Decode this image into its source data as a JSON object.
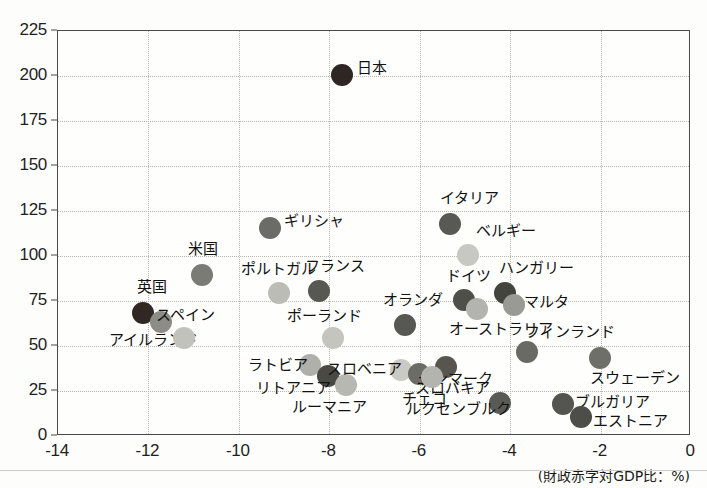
{
  "chart_data": {
    "type": "scatter",
    "title": "",
    "xlabel": "(財政赤字対GDP比：%)",
    "ylabel": "",
    "xlim": [
      -14,
      0
    ],
    "ylim": [
      0,
      225
    ],
    "grid": true,
    "legend": "none",
    "xticks": [
      "-14",
      "-12",
      "-10",
      "-8",
      "-6",
      "-4",
      "-2",
      "0"
    ],
    "xtick_values": [
      -14,
      -12,
      -10,
      -8,
      -6,
      -4,
      -2,
      0
    ],
    "yticks": [
      "0",
      "25",
      "50",
      "75",
      "100",
      "125",
      "150",
      "175",
      "200",
      "225"
    ],
    "ytick_values": [
      0,
      25,
      50,
      75,
      100,
      125,
      150,
      175,
      200,
      225
    ],
    "points": [
      {
        "label": "日本",
        "x": -7.7,
        "y": 200,
        "color": "#2e2622",
        "r": 11,
        "label_dx": 15,
        "label_dy": -7
      },
      {
        "label": "ギリシャ",
        "x": -9.3,
        "y": 115,
        "color": "#6b6b67",
        "r": 11,
        "label_dx": 14,
        "label_dy": -7
      },
      {
        "label": "イタリア",
        "x": -5.3,
        "y": 117,
        "color": "#595954",
        "r": 11,
        "label_dx": -10,
        "label_dy": -26
      },
      {
        "label": "米国",
        "x": -10.8,
        "y": 89,
        "color": "#7b7b76",
        "r": 11,
        "label_dx": -14,
        "label_dy": -26
      },
      {
        "label": "ベルギー",
        "x": -4.9,
        "y": 100,
        "color": "#c8c8c2",
        "r": 11,
        "label_dx": 8,
        "label_dy": -24
      },
      {
        "label": "英国",
        "x": -12.1,
        "y": 68,
        "color": "#322823",
        "r": 11,
        "label_dx": -6,
        "label_dy": -26
      },
      {
        "label": "アイルランド",
        "x": -11.7,
        "y": 63,
        "color": "#8d8d88",
        "r": 11,
        "label_dx": -52,
        "label_dy": 18
      },
      {
        "label": "ポルトガル",
        "x": -9.1,
        "y": 79,
        "color": "#bcbcb6",
        "r": 11,
        "label_dx": -38,
        "label_dy": -24
      },
      {
        "label": "フランス",
        "x": -8.2,
        "y": 80,
        "color": "#585853",
        "r": 11,
        "label_dx": -14,
        "label_dy": -25
      },
      {
        "label": "ドイツ",
        "x": -5.0,
        "y": 75,
        "color": "#4f4f4a",
        "r": 11,
        "label_dx": -18,
        "label_dy": -24
      },
      {
        "label": "ハンガリー",
        "x": -4.1,
        "y": 79,
        "color": "#44443f",
        "r": 11,
        "label_dx": -6,
        "label_dy": -25
      },
      {
        "label": "スペイン",
        "x": -11.2,
        "y": 54,
        "color": "#c2c2bc",
        "r": 11,
        "label_dx": -28,
        "label_dy": -23
      },
      {
        "label": "ポーランド",
        "x": -7.9,
        "y": 54,
        "color": "#c5c5bf",
        "r": 11,
        "label_dx": -46,
        "label_dy": -22
      },
      {
        "label": "オランダ",
        "x": -6.3,
        "y": 61,
        "color": "#585853",
        "r": 11,
        "label_dx": -22,
        "label_dy": -25
      },
      {
        "label": "オーストラリア",
        "x": -4.7,
        "y": 70,
        "color": "#b4b4ae",
        "r": 11,
        "label_dx": -28,
        "label_dy": 20
      },
      {
        "label": "マルタ",
        "x": -3.9,
        "y": 72,
        "color": "#9a9a94",
        "r": 11,
        "label_dx": 10,
        "label_dy": -3
      },
      {
        "label": "フィンランド",
        "x": -3.6,
        "y": 46,
        "color": "#6a6a65",
        "r": 11,
        "label_dx": -2,
        "label_dy": -20
      },
      {
        "label": "スウェーデン",
        "x": -2.0,
        "y": 43,
        "color": "#6f6f6a",
        "r": 11,
        "label_dx": -10,
        "label_dy": 20
      },
      {
        "label": "ラトビア",
        "x": -8.4,
        "y": 39,
        "color": "#b0b0aa",
        "r": 11,
        "label_dx": -62,
        "label_dy": 0
      },
      {
        "label": "リトアニア",
        "x": -8.0,
        "y": 33,
        "color": "#4a4a45",
        "r": 11,
        "label_dx": -72,
        "label_dy": 12
      },
      {
        "label": "ルーマニア",
        "x": -7.6,
        "y": 28,
        "color": "#b8b8b2",
        "r": 11,
        "label_dx": -54,
        "label_dy": 22
      },
      {
        "label": "スロベニア",
        "x": -6.4,
        "y": 36,
        "color": "#cacac4",
        "r": 11,
        "label_dx": -74,
        "label_dy": -1
      },
      {
        "label": "スロバキア",
        "x": -6.0,
        "y": 34,
        "color": "#6c6c67",
        "r": 11,
        "label_dx": -4,
        "label_dy": 14
      },
      {
        "label": "デンマーク",
        "x": -5.4,
        "y": 38,
        "color": "#56564f",
        "r": 11,
        "label_dx": -28,
        "label_dy": 12
      },
      {
        "label": "チェコ",
        "x": -5.7,
        "y": 32,
        "color": "#b4b4ae",
        "r": 11,
        "label_dx": -30,
        "label_dy": 22
      },
      {
        "label": "ルクセンブルク",
        "x": -4.2,
        "y": 18,
        "color": "#5a5a55",
        "r": 11,
        "label_dx": -94,
        "label_dy": 6
      },
      {
        "label": "ブルガリア",
        "x": -2.8,
        "y": 17,
        "color": "#555550",
        "r": 11,
        "label_dx": 12,
        "label_dy": -2
      },
      {
        "label": "エストニア",
        "x": -2.4,
        "y": 10,
        "color": "#4e4e49",
        "r": 11,
        "label_dx": 12,
        "label_dy": 4
      }
    ]
  }
}
